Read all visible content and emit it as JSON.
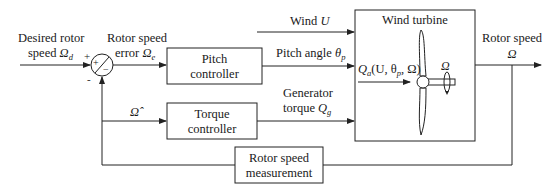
{
  "diagram": {
    "inputs": {
      "desired_speed_line1": "Desired rotor",
      "desired_speed_line2": "speed ",
      "desired_speed_symbol": "Ω",
      "desired_speed_sub": "d"
    },
    "summing_junction": {
      "plus_top_left": "+",
      "minus_bottom": "-",
      "inner_plus": "+",
      "inner_minus": "−"
    },
    "error_label": {
      "line1": "Rotor speed",
      "line2": "error ",
      "symbol": "Ω",
      "sub": "e"
    },
    "blocks": {
      "pitch_controller": {
        "line1": "Pitch",
        "line2": "controller"
      },
      "torque_controller": {
        "line1": "Torque",
        "line2": "controller"
      },
      "wind_turbine": {
        "title": "Wind turbine"
      },
      "rotor_speed_measurement": {
        "line1": "Rotor speed",
        "line2": "measurement"
      }
    },
    "signals": {
      "wind": {
        "text": "Wind ",
        "symbol": "U"
      },
      "pitch_angle": {
        "text": "Pitch angle ",
        "symbol": "θ",
        "sub": "p"
      },
      "generator_torque": {
        "line1": "Generator",
        "line2": "torque ",
        "symbol": "Q",
        "sub": "g"
      },
      "aero_torque": {
        "symbol": "Q",
        "sub": "a",
        "args": "(U, θ",
        "args_sub": "p",
        "args_end": ", Ω)"
      },
      "rotation_symbol": "Ω",
      "estimated_speed": "Ω̂",
      "output": {
        "line1": "Rotor speed",
        "line2": "Ω"
      }
    }
  }
}
